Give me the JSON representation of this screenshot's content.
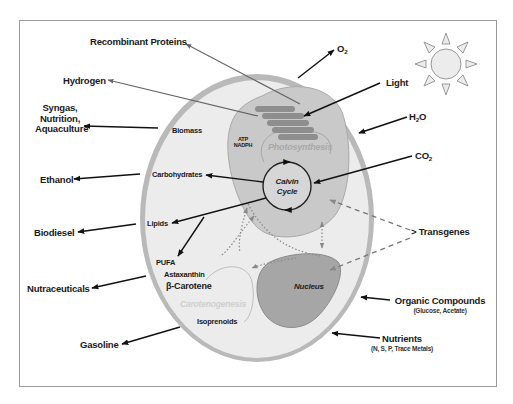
{
  "diagram": {
    "colors": {
      "frame": "#9a9a9a",
      "cell_wall": "#b9b9b9",
      "cell_fill": "#ececec",
      "chloroplast": "#c9c9c9",
      "thylakoid": "#8e8e8e",
      "nucleus": "#a6a6a6",
      "arrow_solid": "#111111",
      "arrow_grey": "#666666",
      "dashed": "#777777"
    },
    "outputs": {
      "recombinant_proteins": "Recombinant Proteins",
      "hydrogen": "Hydrogen",
      "syngas_line1": "Syngas,",
      "syngas_line2": "Nutrition,",
      "syngas_line3": "Aquaculture",
      "ethanol": "Ethanol",
      "biodiesel": "Biodiesel",
      "nutraceuticals": "Nutraceuticals",
      "gasoline": "Gasoline",
      "o2": "O",
      "o2_sub": "2"
    },
    "inputs": {
      "light": "Light",
      "h2o_a": "H",
      "h2o_sub": "2",
      "h2o_b": "O",
      "co2_a": "CO",
      "co2_sub": "2",
      "transgenes": "> Transgenes",
      "organic_compounds": "Organic Compounds",
      "organic_compounds_detail": "(Glucose, Acetate)",
      "nutrients": "Nutrients",
      "nutrients_detail": "(N, S, P, Trace Metals)"
    },
    "cell": {
      "biomass": "Biomass",
      "atp": "ATP",
      "nadph": "NADPH",
      "photosynthesis": "Photosynthesis",
      "calvin_line1": "Calvin",
      "calvin_line2": "Cycle",
      "carbohydrates": "Carbohydrates",
      "lipids": "Lipids",
      "pufa": "PUFA",
      "astaxanthin": "Astaxanthin",
      "beta_carotene": "β-Carotene",
      "carotenogenesis": "Carotenogenesis",
      "isoprenoids": "Isoprenoids",
      "nucleus": "Nucleus"
    },
    "sun_icon": "sun-icon"
  }
}
